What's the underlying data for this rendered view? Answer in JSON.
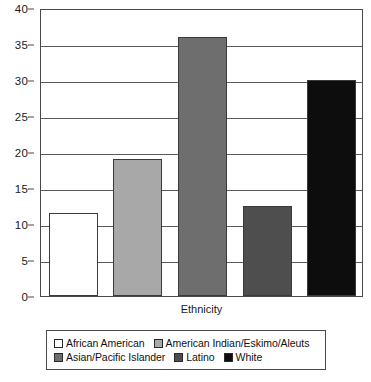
{
  "chart_data": {
    "type": "bar",
    "title": "",
    "xlabel": "Ethnicity",
    "ylabel": "",
    "ylim": [
      0,
      40
    ],
    "yticks": [
      0,
      5,
      10,
      15,
      20,
      25,
      30,
      35,
      40
    ],
    "ytick_labels": [
      "0",
      "5",
      "10",
      "15",
      "20",
      "25",
      "30",
      "35",
      "40"
    ],
    "grid": true,
    "legend_position": "bottom",
    "categories": [
      "African American",
      "American Indian/Eskimo/Aleuts",
      "Asian/Pacific Islander",
      "Latino",
      "White"
    ],
    "values": [
      11.5,
      19,
      36,
      12.5,
      30
    ],
    "colors": [
      "#ffffff",
      "#a8a8a8",
      "#6e6e6e",
      "#4e4e4e",
      "#0d0d0d"
    ]
  },
  "axes": {
    "x_axis_label": "Ethnicity"
  },
  "legend": {
    "rows": [
      [
        {
          "label": "African American",
          "color": "#ffffff"
        },
        {
          "label": "American Indian/Eskimo/Aleuts",
          "color": "#a8a8a8"
        }
      ],
      [
        {
          "label": "Asian/Pacific Islander",
          "color": "#6e6e6e"
        },
        {
          "label": "Latino",
          "color": "#4e4e4e"
        },
        {
          "label": "White",
          "color": "#0d0d0d"
        }
      ]
    ]
  }
}
